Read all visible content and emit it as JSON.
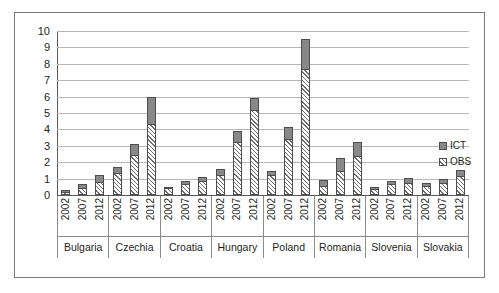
{
  "chart_data": {
    "type": "bar",
    "subtype": "stacked-grouped",
    "title": "",
    "xlabel": "",
    "ylabel": "",
    "ylim": [
      0,
      10
    ],
    "yticks": [
      0,
      1,
      2,
      3,
      4,
      5,
      6,
      7,
      8,
      9,
      10
    ],
    "ytick_labels": [
      "0",
      "1",
      "2",
      "3",
      "4",
      "5",
      "6",
      "7",
      "8",
      "9",
      "10"
    ],
    "grid": true,
    "legend_position": "right",
    "legend": [
      {
        "name": "ICT",
        "style": "solid-gray",
        "color": "#888888"
      },
      {
        "name": "OBS",
        "style": "hatched",
        "color": "#ffffff"
      }
    ],
    "categories": [
      "Bulgaria",
      "Czechia",
      "Croatia",
      "Hungary",
      "Poland",
      "Romania",
      "Slovenia",
      "Slovakia"
    ],
    "subcategories": [
      "2002",
      "2007",
      "2012"
    ],
    "series": [
      {
        "name": "OBS",
        "values": [
          [
            0.18,
            0.45,
            0.8
          ],
          [
            1.35,
            2.45,
            4.3
          ],
          [
            0.4,
            0.7,
            0.85
          ],
          [
            1.2,
            3.25,
            5.2
          ],
          [
            3.4,
            7.7,
            0.55
          ],
          [
            1.45,
            2.35,
            0.35
          ],
          [
            0.65,
            0.75,
            0.8
          ],
          [
            0.75,
            0.95,
            1.15
          ]
        ]
      },
      {
        "name": "ICT",
        "values": [
          [
            0.12,
            0.2,
            0.4
          ],
          [
            0.35,
            0.65,
            1.7
          ],
          [
            0.1,
            0.15,
            0.25
          ],
          [
            0.4,
            0.65,
            0.7
          ],
          [
            0.75,
            1.8,
            0.35
          ],
          [
            0.8,
            0.9,
            0.15
          ],
          [
            0.2,
            0.3,
            0.3
          ],
          [
            0.2,
            0.25,
            0.35
          ]
        ]
      }
    ],
    "bars": [
      {
        "country": "Bulgaria",
        "year": "2002",
        "obs": 0.18,
        "ict": 0.12,
        "total": 0.3
      },
      {
        "country": "Bulgaria",
        "year": "2007",
        "obs": 0.45,
        "ict": 0.2,
        "total": 0.65
      },
      {
        "country": "Bulgaria",
        "year": "2012",
        "obs": 0.8,
        "ict": 0.4,
        "total": 1.2
      },
      {
        "country": "Czechia",
        "year": "2002",
        "obs": 1.35,
        "ict": 0.35,
        "total": 1.7
      },
      {
        "country": "Czechia",
        "year": "2007",
        "obs": 2.45,
        "ict": 0.65,
        "total": 3.1
      },
      {
        "country": "Czechia",
        "year": "2012",
        "obs": 4.3,
        "ict": 1.7,
        "total": 6.0
      },
      {
        "country": "Croatia",
        "year": "2002",
        "obs": 0.4,
        "ict": 0.1,
        "total": 0.5
      },
      {
        "country": "Croatia",
        "year": "2007",
        "obs": 0.7,
        "ict": 0.15,
        "total": 0.85
      },
      {
        "country": "Croatia",
        "year": "2012",
        "obs": 0.85,
        "ict": 0.25,
        "total": 1.1
      },
      {
        "country": "Hungary",
        "year": "2002",
        "obs": 1.2,
        "ict": 0.4,
        "total": 1.6
      },
      {
        "country": "Hungary",
        "year": "2007",
        "obs": 3.25,
        "ict": 0.65,
        "total": 3.9
      },
      {
        "country": "Hungary",
        "year": "2012",
        "obs": 5.2,
        "ict": 0.7,
        "total": 5.9
      },
      {
        "country": "Poland",
        "year": "2002",
        "obs": 1.2,
        "ict": 0.25,
        "total": 1.45
      },
      {
        "country": "Poland",
        "year": "2007",
        "obs": 3.4,
        "ict": 0.75,
        "total": 4.15
      },
      {
        "country": "Poland",
        "year": "2012",
        "obs": 7.7,
        "ict": 1.8,
        "total": 9.5
      },
      {
        "country": "Romania",
        "year": "2002",
        "obs": 0.55,
        "ict": 0.35,
        "total": 0.9
      },
      {
        "country": "Romania",
        "year": "2007",
        "obs": 1.45,
        "ict": 0.8,
        "total": 2.25
      },
      {
        "country": "Romania",
        "year": "2012",
        "obs": 2.35,
        "ict": 0.9,
        "total": 3.25
      },
      {
        "country": "Slovenia",
        "year": "2002",
        "obs": 0.35,
        "ict": 0.15,
        "total": 0.5
      },
      {
        "country": "Slovenia",
        "year": "2007",
        "obs": 0.65,
        "ict": 0.2,
        "total": 0.85
      },
      {
        "country": "Slovenia",
        "year": "2012",
        "obs": 0.75,
        "ict": 0.3,
        "total": 1.05
      },
      {
        "country": "Slovakia",
        "year": "2002",
        "obs": 0.55,
        "ict": 0.2,
        "total": 0.75
      },
      {
        "country": "Slovakia",
        "year": "2007",
        "obs": 0.75,
        "ict": 0.25,
        "total": 1.0
      },
      {
        "country": "Slovakia",
        "year": "2012",
        "obs": 1.15,
        "ict": 0.35,
        "total": 1.5
      }
    ]
  }
}
